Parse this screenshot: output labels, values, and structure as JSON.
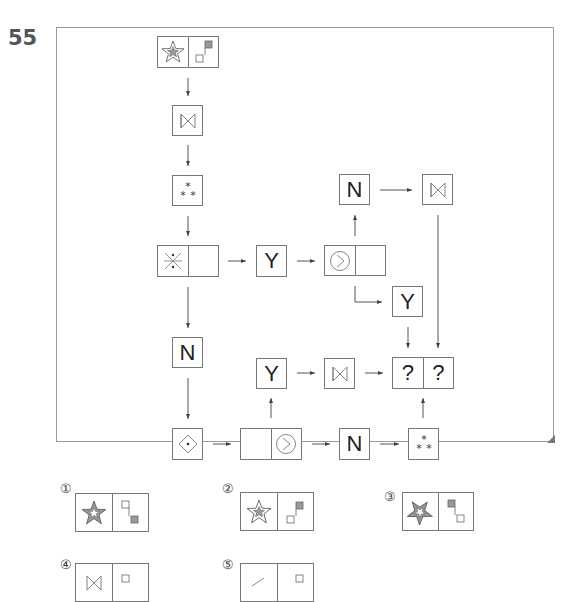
{
  "question": {
    "number": "55"
  },
  "diagram": {
    "start_node": {
      "left": "star-in-star",
      "right": "two-squares-upper-filled"
    },
    "nodes": {
      "bowtie_1": "bowtie",
      "asterisks_1": "three-asterisks",
      "x_node": {
        "left": "x-with-dots",
        "right": "empty"
      },
      "y_1": "Y",
      "circle_node": {
        "left": "circle-chevron",
        "right": "empty"
      },
      "n_top": "N",
      "bowtie_top": "bowtie",
      "y_right": "Y",
      "n_left": "N",
      "y_mid": "Y",
      "bowtie_mid": "bowtie",
      "answer": {
        "left": "?",
        "right": "?"
      },
      "diamond": "diamond-dot",
      "empty_circle": {
        "left": "empty",
        "right": "circle-chevron"
      },
      "n_bottom": "N",
      "asterisks_bottom": "three-asterisks"
    },
    "labels": {
      "Y": "Y",
      "N": "N",
      "Q": "?"
    }
  },
  "options": [
    {
      "label": "①",
      "left": "star-filled-outer-white-inner",
      "right": "squares-upper-white-lower-filled"
    },
    {
      "label": "②",
      "left": "star-white-outer-filled-inner",
      "right": "squares-upper-filled-lower-white"
    },
    {
      "label": "③",
      "left": "star-rotated-filled",
      "right": "squares-upper-filled-lower-white"
    },
    {
      "label": "④",
      "left": "bowtie",
      "right": "square"
    },
    {
      "label": "⑤",
      "left": "partial-shape",
      "right": "square"
    }
  ]
}
